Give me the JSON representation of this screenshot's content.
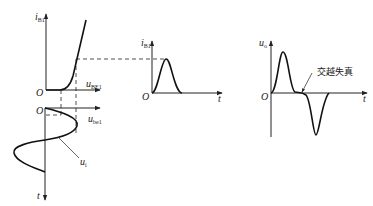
{
  "diagram": {
    "input_char": {
      "y_label_main": "i",
      "y_label_sub": "B1",
      "x_label_main": "u",
      "x_label_sub": "BE1",
      "origin": "O"
    },
    "input_wave": {
      "x_label_main": "u",
      "x_label_sub": "be1",
      "y_label": "t",
      "origin": "O",
      "curve_label_main": "u",
      "curve_label_sub": "i"
    },
    "base_current": {
      "y_label_main": "i",
      "y_label_sub": "B1",
      "x_label": "t",
      "origin": "O"
    },
    "output": {
      "y_label_main": "u",
      "y_label_sub": "o",
      "x_label": "t",
      "origin": "O",
      "annotation": "交越失真"
    }
  }
}
